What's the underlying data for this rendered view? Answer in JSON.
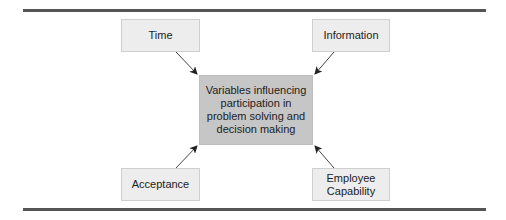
{
  "diagram": {
    "center": {
      "label": "Variables influencing participation in problem solving and decision making",
      "lines": [
        "Variables influencing",
        "participation in",
        "problem solving and",
        "decision making"
      ]
    },
    "nodes": [
      {
        "id": "time",
        "label": "Time",
        "position": "top-left"
      },
      {
        "id": "information",
        "label": "Information",
        "position": "top-right"
      },
      {
        "id": "acceptance",
        "label": "Acceptance",
        "position": "bottom-left"
      },
      {
        "id": "employee-capability",
        "label": "Employee Capability",
        "lines": [
          "Employee",
          "Capability"
        ],
        "position": "bottom-right"
      }
    ],
    "edges": [
      {
        "from": "time",
        "to": "center"
      },
      {
        "from": "information",
        "to": "center"
      },
      {
        "from": "acceptance",
        "to": "center"
      },
      {
        "from": "employee-capability",
        "to": "center"
      }
    ],
    "colors": {
      "rule": "#555555",
      "outer_box_fill": "#ededed",
      "center_box_fill": "#c6c6c6",
      "arrow": "#333333"
    }
  }
}
